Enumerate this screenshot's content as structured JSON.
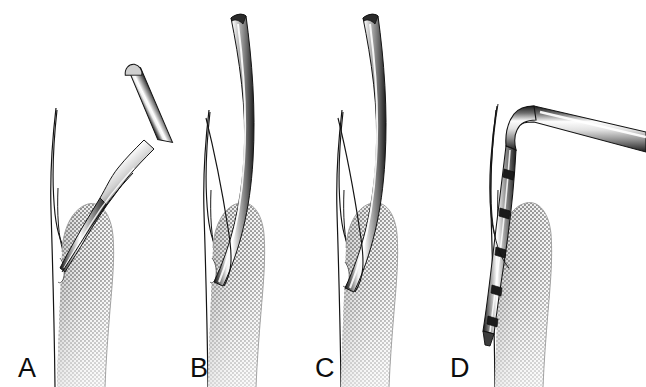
{
  "figure": {
    "background_color": "#ffffff",
    "width": 646,
    "height": 387,
    "style": "grayscale medical line illustration with halftone stipple shading",
    "panel_count": 4
  },
  "palette": {
    "background": "#ffffff",
    "outline": "#111111",
    "instrument_dark": "#1a1a1a",
    "instrument_mid": "#8a8a8a",
    "instrument_highlight": "#ffffff",
    "gingiva_dark": "#9a9a9a",
    "gingiva_mid": "#b4b4b4",
    "gingiva_light": "#d8d8d8",
    "tooth_fill": "#ffffff",
    "label_color": "#0d0d0d"
  },
  "panels": [
    {
      "id": "panel-a",
      "label": "A",
      "label_x": 18,
      "label_y": 377,
      "instrument": "curved-shank-curette",
      "instrument_angle": "angled shank entering pocket from coronal-oblique direction",
      "description": "Curved curette with angled shank adapted at the gingival margin, working end directed into the sulcus",
      "anatomy": [
        "tooth",
        "gingiva",
        "gingival-papilla",
        "sulcus"
      ]
    },
    {
      "id": "panel-b",
      "label": "B",
      "label_x": 190,
      "label_y": 377,
      "instrument": "straight-slender-probe",
      "instrument_angle": "near-vertical, slightly inclined shank",
      "description": "Slender straight instrument inserted parallel to the root surface reaching the base of the pocket",
      "anatomy": [
        "tooth",
        "gingiva",
        "gingival-papilla",
        "sulcus"
      ]
    },
    {
      "id": "panel-c",
      "label": "C",
      "label_x": 315,
      "label_y": 377,
      "instrument": "straight-slender-probe",
      "instrument_angle": "near-vertical, slightly inclined shank",
      "description": "Slender straight instrument advanced further apically within the periodontal pocket",
      "anatomy": [
        "tooth",
        "gingiva",
        "gingival-papilla",
        "sulcus"
      ]
    },
    {
      "id": "panel-d",
      "label": "D",
      "label_x": 450,
      "label_y": 377,
      "instrument": "banded-periodontal-probe",
      "instrument_angle": "right-angle bend; handle extends to upper right",
      "description": "Calibrated periodontal probe with dark measurement bands inserted to the base of the pocket",
      "band_count": 5,
      "anatomy": [
        "tooth",
        "gingiva",
        "gingival-papilla",
        "sulcus"
      ]
    }
  ]
}
